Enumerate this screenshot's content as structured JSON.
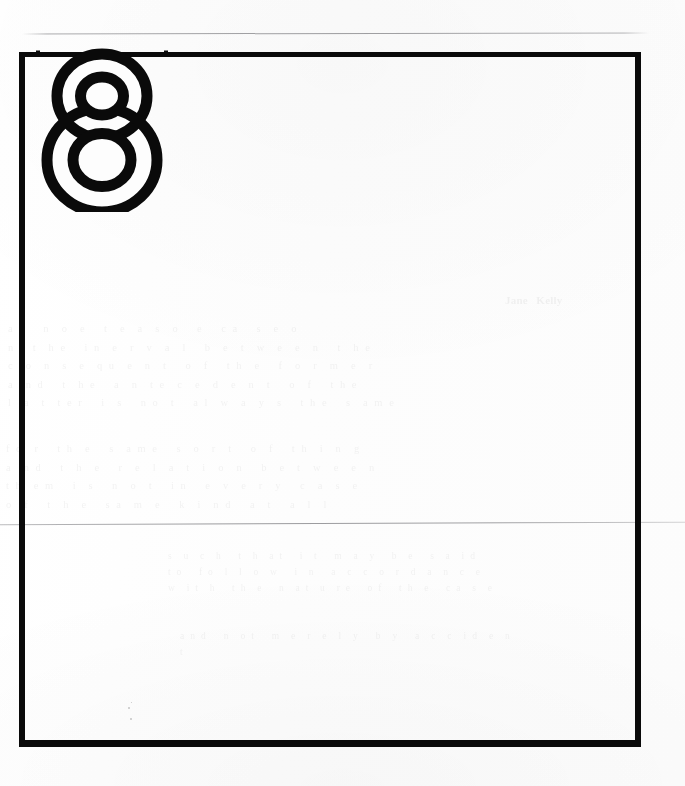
{
  "document": {
    "kind": "scanned-page",
    "page_number": "8",
    "page_number_style": "outlined-numeral",
    "background_color": "#fdfdfd",
    "ink_color": "#0a0a0a",
    "rule_color": "#78787c"
  },
  "frame": {
    "name": "page-border-frame",
    "shape": "rectangle",
    "stroke_color": "#0a0a0a",
    "stroke_top": "5px",
    "stroke_left": "6px",
    "stroke_right": "6px",
    "stroke_bottom": "7px",
    "x": "19px",
    "y": "52px",
    "width": "622px",
    "height": "695px"
  },
  "page_number_mark": {
    "label": "8",
    "description": "large outlined figure-eight overlapping the top border rule",
    "x": "36px",
    "y": "44px",
    "width": "132px",
    "height": "168px"
  },
  "rules": [
    {
      "name": "top-scanner-rule",
      "y": "33px",
      "x": "22px",
      "width": "627px"
    },
    {
      "name": "middle-fold-rule",
      "y": "523px",
      "x": "0px",
      "width": "685px"
    }
  ],
  "bleed_through": {
    "note": "illegible ghost text showing through from the reverse side of the sheet",
    "heading": "Jane Kelly",
    "upper_paragraph": "a e   n  o  e   t  e  a  s  o   e   c a   s  e  o\nn   t  h e   i n  e  r  v  a  l   b  e  t  w  e  e  n   t  h e\nc  o  n  s  e  q u  e  n  t   o  f   t h  e   f  o  r  m  e  r\na  n d   t  h e   a  n  t e  c  e  d  e  n  t   o  f   t h e\nl  a  t  t e r   i  s   n o  t   a l  w  a  y  s   t h e   s  a m e",
    "mid_paragraph": "f o  r   t h  e   s  a m e   s  o  r  t   o  f   t h  i  n  g\na  n d   t  h  e   r  e  l  a  t  i  o  n   b  e  t  w  e  e  n\nt h  e m   i  s   n  o  t   i n   e  v  e  r  y   c  a  s  e\no  f   t  h  e   s a  m  e   k  i  n d   a  t   a  l  l",
    "lower_paragraph": "s  u  c  h   t  h  a t   i  t   m  a  y   b  e   s  a  i d\nt o   f o  l  l  o  w   i  n   a  c  c  o  r  d  a  n  c  e\nw  i t  h   t h  e   n  a t  u  r e   o f   t h  e   c a  s  e",
    "tail_paragraph": "a n d   n  o t   m  e  r  e  l  y   b  y   a  c  c  i d  e  n  t"
  },
  "specks": [
    {
      "x": "128px",
      "y": "707px",
      "size": "2px"
    },
    {
      "x": "130px",
      "y": "718px",
      "size": "2px"
    },
    {
      "x": "131px",
      "y": "702px",
      "size": "1px"
    }
  ]
}
